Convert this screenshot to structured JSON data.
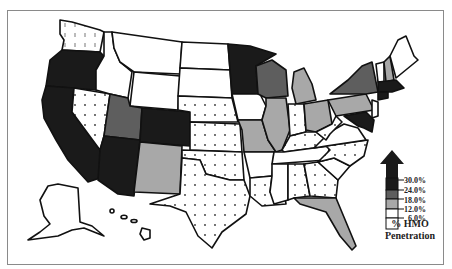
{
  "map": {
    "title": "% HMO Penetration",
    "legend": {
      "title_line1": "% HMO",
      "title_line2": "Penetration",
      "bins": [
        {
          "label": "30.0%",
          "color": "#1a1a1a"
        },
        {
          "label": "24.0%",
          "color": "#5e5e5e"
        },
        {
          "label": "18.0%",
          "color": "#a8a8a8"
        },
        {
          "label": "12.0%",
          "color": "#ffffff"
        },
        {
          "label": "6.0%",
          "color": "#ffffff",
          "pattern": "dots"
        }
      ]
    },
    "colors": {
      "highest": "#1a1a1a",
      "high": "#5e5e5e",
      "mid": "#a8a8a8",
      "low": "#ffffff",
      "lowest_dotted": "#ffffff"
    },
    "states": {
      "highest": [
        "California",
        "Oregon",
        "Arizona",
        "Colorado",
        "Minnesota",
        "Massachusetts",
        "Maryland",
        "Connecticut",
        "Rhode Island"
      ],
      "high": [
        "Utah",
        "Wisconsin",
        "New York"
      ],
      "mid": [
        "New Mexico",
        "Missouri",
        "Illinois",
        "Michigan",
        "Ohio",
        "Pennsylvania",
        "Florida",
        "New Hampshire"
      ],
      "low": [
        "Idaho",
        "Montana",
        "Wyoming",
        "North Dakota",
        "South Dakota",
        "Iowa",
        "Arkansas",
        "Mississippi",
        "Tennessee",
        "South Carolina",
        "Virginia",
        "Maine",
        "Vermont",
        "Alaska",
        "Hawaii",
        "New Jersey",
        "Delaware"
      ],
      "lowest_dotted": [
        "Washington",
        "Nevada",
        "Nebraska",
        "Kansas",
        "Oklahoma",
        "Texas",
        "Louisiana",
        "Alabama",
        "Georgia",
        "Indiana",
        "Kentucky",
        "West Virginia",
        "North Carolina"
      ]
    }
  }
}
